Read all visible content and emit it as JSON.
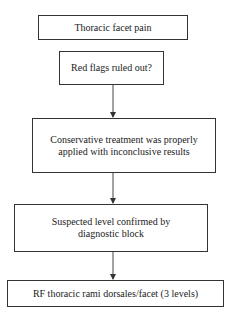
{
  "diagram": {
    "type": "flowchart",
    "nodes": [
      {
        "id": "n1",
        "label": "Thoracic facet pain",
        "lines": [
          "Thoracic facet pain"
        ]
      },
      {
        "id": "n2",
        "label": "Red flags ruled out?",
        "lines": [
          "Red flags ruled out?"
        ]
      },
      {
        "id": "n3",
        "label": "Conservative treatment was properly applied with inconclusive results",
        "lines": [
          "Conservative treatment was properly",
          "applied with inconclusive results"
        ]
      },
      {
        "id": "n4",
        "label": "Suspected level confirmed by diagnostic block",
        "lines": [
          "Suspected level confirmed by",
          "diagnostic block"
        ]
      },
      {
        "id": "n5",
        "label": "RF thoracic rami dorsales/facet (3 levels)",
        "lines": [
          "RF thoracic rami dorsales/facet (3 levels)"
        ]
      }
    ],
    "edges": [
      {
        "from": "n2",
        "to": "n3"
      },
      {
        "from": "n3",
        "to": "n4"
      },
      {
        "from": "n4",
        "to": "n5"
      }
    ],
    "colors": {
      "stroke": "#333333",
      "background": "#ffffff",
      "text": "#222222"
    }
  }
}
